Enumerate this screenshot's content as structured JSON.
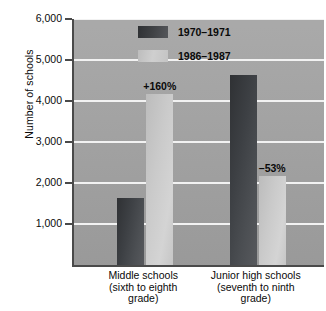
{
  "chart_data": {
    "type": "bar",
    "title": "",
    "subtitle": "",
    "xlabel": "",
    "ylabel": "Number of schools",
    "ylim": [
      0,
      6000
    ],
    "ytick_values": [
      1000,
      2000,
      3000,
      4000,
      5000,
      6000
    ],
    "ytick_labels": [
      "1,000",
      "2,000",
      "3,000",
      "4,000",
      "5,000",
      "6,000"
    ],
    "grid": true,
    "legend_position": "inside-top-left",
    "categories": [
      "Middle schools (sixth to eighth grade)",
      "Junior high schools (seventh to ninth grade)"
    ],
    "category_lines": [
      [
        "Middle schools",
        "(sixth to eighth",
        "grade)"
      ],
      [
        "Junior high schools",
        "(seventh to ninth",
        "grade)"
      ]
    ],
    "series": [
      {
        "name": "1970–1971",
        "color": "#3d4044",
        "values": [
          1630,
          4630
        ]
      },
      {
        "name": "1986–1987",
        "color": "#cacaca",
        "values": [
          4180,
          2170
        ]
      }
    ],
    "annotations": [
      {
        "text": "+160%",
        "category": "Middle schools (sixth to eighth grade)",
        "series": "1986–1987",
        "value": 4180
      },
      {
        "text": "–53%",
        "category": "Junior high schools (seventh to ninth grade)",
        "series": "1986–1987",
        "value": 2170
      }
    ],
    "colors": {
      "plot_background": "#a3a3a3",
      "page_background": "#ffffff",
      "gridline": "#f2f2f2",
      "axis": "#4a4a4a",
      "text": "#0a0a0a"
    }
  }
}
